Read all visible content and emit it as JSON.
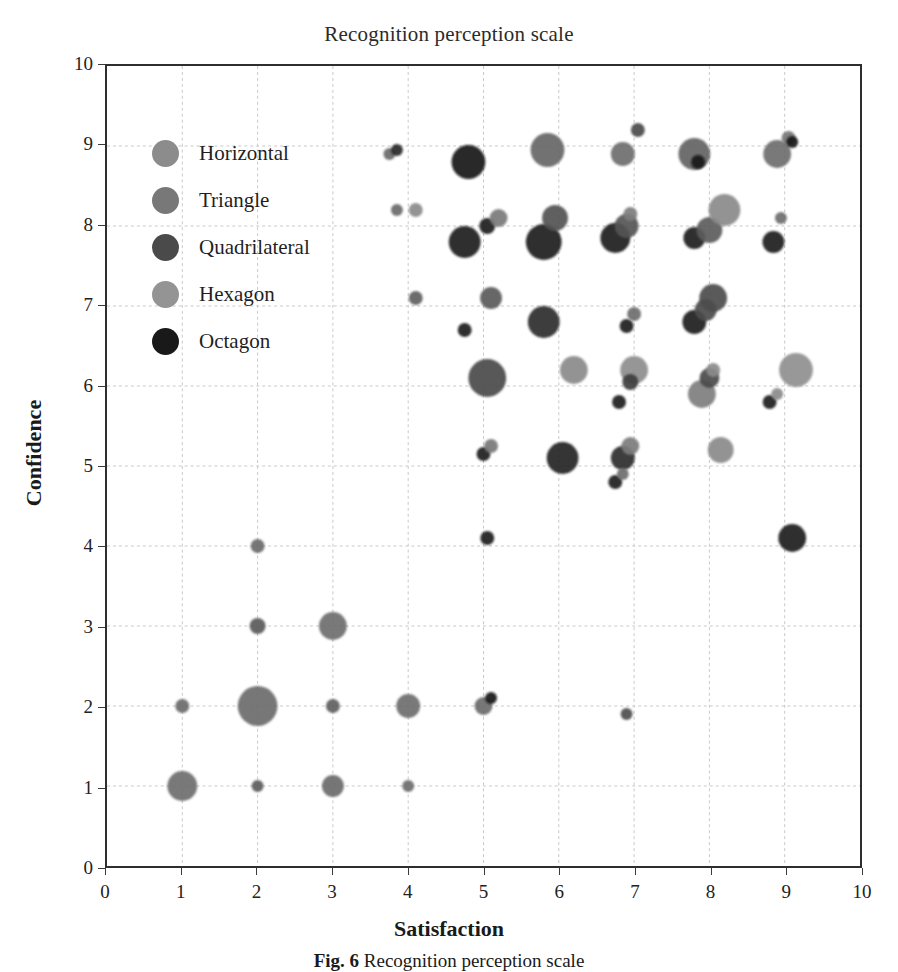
{
  "chart_data": {
    "type": "scatter",
    "title": "Recognition perception scale",
    "xlabel": "Satisfaction",
    "ylabel": "Confidence",
    "xlim": [
      0,
      10
    ],
    "ylim": [
      0,
      10
    ],
    "xticks": [
      "0",
      "1",
      "2",
      "3",
      "4",
      "5",
      "6",
      "7",
      "8",
      "9",
      "10"
    ],
    "yticks": [
      "0",
      "1",
      "2",
      "3",
      "4",
      "5",
      "6",
      "7",
      "8",
      "9",
      "10"
    ],
    "grid": true,
    "legend_position": "inside-top-left",
    "series": [
      {
        "name": "Horizontal",
        "color": "#8c8c8c"
      },
      {
        "name": "Triangle",
        "color": "#787878"
      },
      {
        "name": "Quadrilateral",
        "color": "#4a4a4a"
      },
      {
        "name": "Hexagon",
        "color": "#949494"
      },
      {
        "name": "Octagon",
        "color": "#191919"
      }
    ],
    "points": [
      {
        "x": 1.0,
        "y": 1.0,
        "r": 15,
        "c": "#6e6e6e"
      },
      {
        "x": 2.0,
        "y": 1.0,
        "r": 6,
        "c": "#5c5c5c"
      },
      {
        "x": 3.0,
        "y": 1.0,
        "r": 11,
        "c": "#6a6a6a"
      },
      {
        "x": 4.0,
        "y": 1.0,
        "r": 6,
        "c": "#6e6e6e"
      },
      {
        "x": 1.0,
        "y": 2.0,
        "r": 7,
        "c": "#6a6a6a"
      },
      {
        "x": 2.0,
        "y": 2.0,
        "r": 20,
        "c": "#6b6b6b"
      },
      {
        "x": 3.0,
        "y": 2.0,
        "r": 7,
        "c": "#5e5e5e"
      },
      {
        "x": 4.0,
        "y": 2.0,
        "r": 12,
        "c": "#6e6e6e"
      },
      {
        "x": 5.0,
        "y": 2.0,
        "r": 9,
        "c": "#6b6b6b"
      },
      {
        "x": 5.1,
        "y": 2.1,
        "r": 6,
        "c": "#161616"
      },
      {
        "x": 6.9,
        "y": 1.9,
        "r": 6,
        "c": "#4f4f4f"
      },
      {
        "x": 2.0,
        "y": 3.0,
        "r": 8,
        "c": "#5a5a5a"
      },
      {
        "x": 3.0,
        "y": 3.0,
        "r": 14,
        "c": "#6d6d6d"
      },
      {
        "x": 2.0,
        "y": 4.0,
        "r": 7,
        "c": "#6a6a6a"
      },
      {
        "x": 5.05,
        "y": 4.1,
        "r": 7,
        "c": "#1d1d1d"
      },
      {
        "x": 9.1,
        "y": 4.1,
        "r": 14,
        "c": "#202020"
      },
      {
        "x": 5.0,
        "y": 5.15,
        "r": 7,
        "c": "#1c1c1c"
      },
      {
        "x": 5.1,
        "y": 5.25,
        "r": 7,
        "c": "#787878"
      },
      {
        "x": 6.05,
        "y": 5.1,
        "r": 16,
        "c": "#252525"
      },
      {
        "x": 6.85,
        "y": 5.1,
        "r": 12,
        "c": "#2a2a2a"
      },
      {
        "x": 6.95,
        "y": 5.25,
        "r": 9,
        "c": "#7c7c7c"
      },
      {
        "x": 6.75,
        "y": 4.8,
        "r": 7,
        "c": "#1b1b1b"
      },
      {
        "x": 6.85,
        "y": 4.9,
        "r": 6,
        "c": "#6e6e6e"
      },
      {
        "x": 8.15,
        "y": 5.2,
        "r": 13,
        "c": "#8a8a8a"
      },
      {
        "x": 5.05,
        "y": 6.1,
        "r": 19,
        "c": "#4a4a4a"
      },
      {
        "x": 6.2,
        "y": 6.2,
        "r": 14,
        "c": "#8a8a8a"
      },
      {
        "x": 6.8,
        "y": 5.8,
        "r": 7,
        "c": "#1d1d1d"
      },
      {
        "x": 7.0,
        "y": 6.2,
        "r": 14,
        "c": "#8d8d8d"
      },
      {
        "x": 6.95,
        "y": 6.05,
        "r": 8,
        "c": "#3c3c3c"
      },
      {
        "x": 7.9,
        "y": 5.9,
        "r": 14,
        "c": "#7e7e7e"
      },
      {
        "x": 8.0,
        "y": 6.1,
        "r": 10,
        "c": "#4a4a4a"
      },
      {
        "x": 8.05,
        "y": 6.2,
        "r": 7,
        "c": "#8a8a8a"
      },
      {
        "x": 8.8,
        "y": 5.8,
        "r": 7,
        "c": "#202020"
      },
      {
        "x": 8.9,
        "y": 5.9,
        "r": 6,
        "c": "#8a8a8a"
      },
      {
        "x": 9.15,
        "y": 6.2,
        "r": 17,
        "c": "#8f8f8f"
      },
      {
        "x": 4.1,
        "y": 7.1,
        "r": 7,
        "c": "#5e5e5e"
      },
      {
        "x": 5.1,
        "y": 7.1,
        "r": 11,
        "c": "#5a5a5a"
      },
      {
        "x": 5.8,
        "y": 6.8,
        "r": 16,
        "c": "#2a2a2a"
      },
      {
        "x": 4.75,
        "y": 6.7,
        "r": 7,
        "c": "#1d1d1d"
      },
      {
        "x": 6.9,
        "y": 6.75,
        "r": 7,
        "c": "#1c1c1c"
      },
      {
        "x": 7.0,
        "y": 6.9,
        "r": 7,
        "c": "#6e6e6e"
      },
      {
        "x": 7.8,
        "y": 6.8,
        "r": 12,
        "c": "#1f1f1f"
      },
      {
        "x": 7.95,
        "y": 6.95,
        "r": 11,
        "c": "#4c4c4c"
      },
      {
        "x": 8.05,
        "y": 7.1,
        "r": 14,
        "c": "#4c4c4c"
      },
      {
        "x": 3.85,
        "y": 8.2,
        "r": 6,
        "c": "#6a6a6a"
      },
      {
        "x": 4.1,
        "y": 8.2,
        "r": 7,
        "c": "#8a8a8a"
      },
      {
        "x": 4.75,
        "y": 7.8,
        "r": 16,
        "c": "#1e1e1e"
      },
      {
        "x": 5.05,
        "y": 8.0,
        "r": 8,
        "c": "#1d1d1d"
      },
      {
        "x": 5.2,
        "y": 8.1,
        "r": 9,
        "c": "#7a7a7a"
      },
      {
        "x": 5.8,
        "y": 7.8,
        "r": 18,
        "c": "#202020"
      },
      {
        "x": 5.95,
        "y": 8.1,
        "r": 13,
        "c": "#525252"
      },
      {
        "x": 6.75,
        "y": 7.85,
        "r": 15,
        "c": "#1f1f1f"
      },
      {
        "x": 6.9,
        "y": 8.0,
        "r": 12,
        "c": "#555555"
      },
      {
        "x": 6.95,
        "y": 8.15,
        "r": 7,
        "c": "#7d7d7d"
      },
      {
        "x": 7.8,
        "y": 7.85,
        "r": 11,
        "c": "#1f1f1f"
      },
      {
        "x": 8.0,
        "y": 7.95,
        "r": 13,
        "c": "#5c5c5c"
      },
      {
        "x": 8.2,
        "y": 8.2,
        "r": 16,
        "c": "#8a8a8a"
      },
      {
        "x": 8.85,
        "y": 7.8,
        "r": 11,
        "c": "#1f1f1f"
      },
      {
        "x": 8.95,
        "y": 8.1,
        "r": 6,
        "c": "#6e6e6e"
      },
      {
        "x": 3.75,
        "y": 8.9,
        "r": 6,
        "c": "#6a6a6a"
      },
      {
        "x": 3.85,
        "y": 8.95,
        "r": 6,
        "c": "#272727"
      },
      {
        "x": 4.8,
        "y": 8.8,
        "r": 17,
        "c": "#141414"
      },
      {
        "x": 5.85,
        "y": 8.95,
        "r": 17,
        "c": "#666666"
      },
      {
        "x": 6.85,
        "y": 8.9,
        "r": 12,
        "c": "#6e6e6e"
      },
      {
        "x": 7.05,
        "y": 9.2,
        "r": 7,
        "c": "#4a4a4a"
      },
      {
        "x": 7.8,
        "y": 8.9,
        "r": 16,
        "c": "#636363"
      },
      {
        "x": 7.85,
        "y": 8.8,
        "r": 7,
        "c": "#141414"
      },
      {
        "x": 8.9,
        "y": 8.9,
        "r": 14,
        "c": "#6d6d6d"
      },
      {
        "x": 9.05,
        "y": 9.1,
        "r": 7,
        "c": "#757575"
      },
      {
        "x": 9.1,
        "y": 9.05,
        "r": 6,
        "c": "#1a1a1a"
      }
    ]
  },
  "caption": {
    "label": "Fig. 6",
    "text": "Recognition perception scale"
  }
}
